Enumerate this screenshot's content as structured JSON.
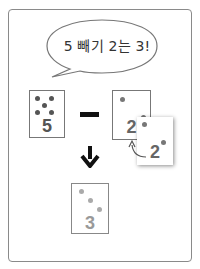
{
  "speech_bubble": {
    "text": "5 빼기 2는 3!"
  },
  "operator": "minus",
  "cards": {
    "minuend": {
      "number": "5",
      "dots": 5,
      "color": "#555555"
    },
    "subtrahend": {
      "number": "2",
      "dots": 1,
      "color": "#666666"
    },
    "removed": {
      "number": "2",
      "dots": 2,
      "color": "#666666"
    },
    "result": {
      "number": "3",
      "dots": 3,
      "color": "#999999"
    }
  },
  "arrows": [
    "curved-arrow",
    "down-arrow"
  ]
}
